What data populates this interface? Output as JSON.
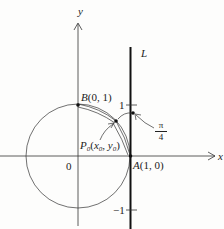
{
  "diagram": {
    "axes": {
      "x_label": "x",
      "y_label": "y",
      "origin_label": "0"
    },
    "line": {
      "label": "L",
      "tick_top": "1",
      "tick_bottom": "−1"
    },
    "points": {
      "B": {
        "name": "B",
        "coords": "(0, 1)"
      },
      "A": {
        "name": "A",
        "coords": "(1, 0)"
      },
      "P0": {
        "name": "P",
        "sub": "0",
        "open": "(",
        "x": "x",
        "xsub": "0",
        "sep": ", ",
        "y": "y",
        "ysub": "0",
        "close": ")"
      }
    },
    "angle": {
      "numerator": "π",
      "denominator": "4"
    },
    "colors": {
      "ink": "#222222",
      "background": "#fdfdfc"
    }
  }
}
